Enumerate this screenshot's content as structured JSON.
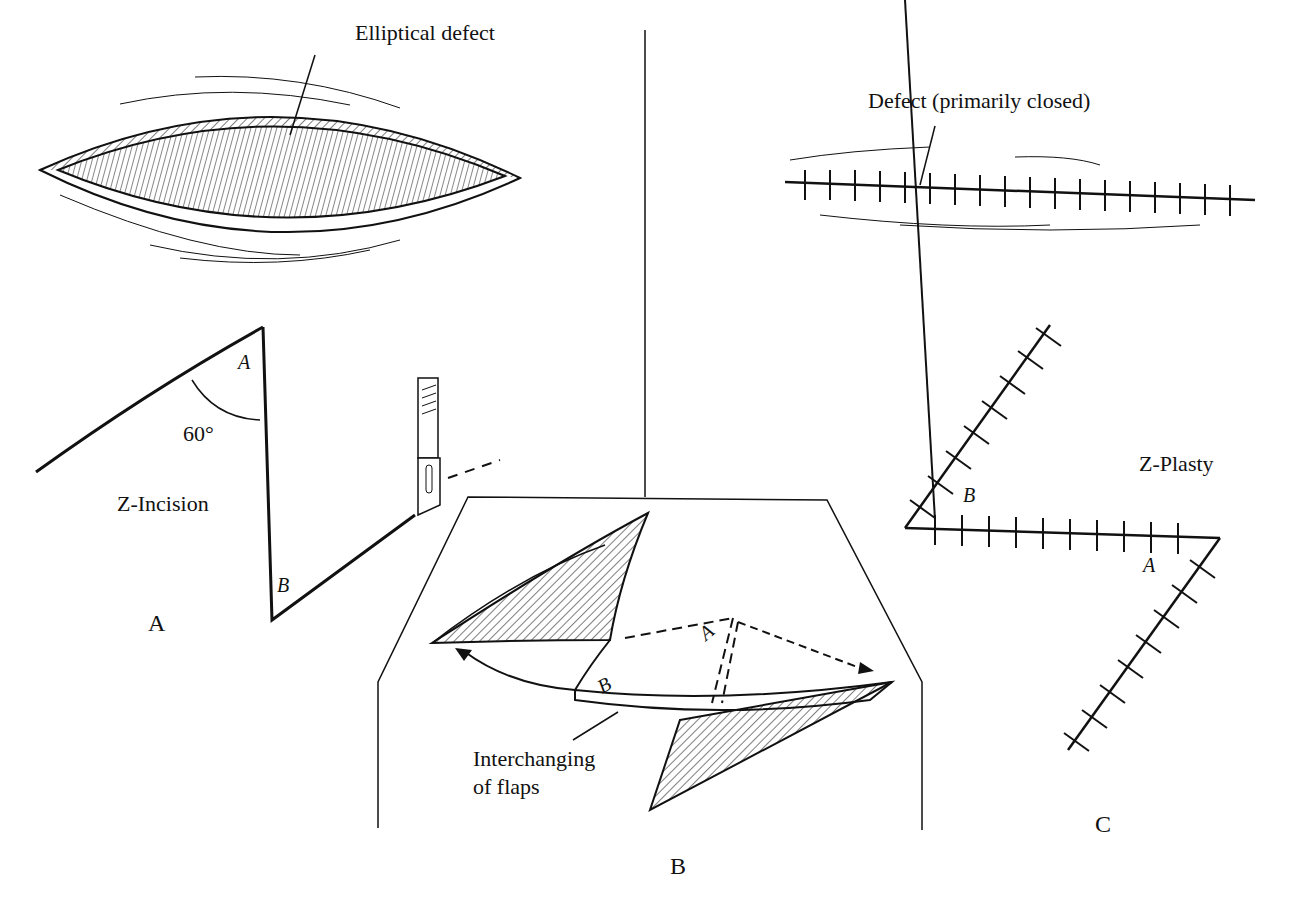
{
  "figure": {
    "panels": [
      {
        "id": "A",
        "label": "A",
        "caption": "Z-Incision",
        "angle_label": "60°",
        "point_labels": [
          "A",
          "B"
        ]
      },
      {
        "id": "B",
        "label": "B",
        "caption": "Interchanging\nof flaps",
        "point_labels": [
          "A",
          "B"
        ]
      },
      {
        "id": "C",
        "label": "C",
        "caption": "Z-Plasty",
        "point_labels": [
          "B",
          "A"
        ]
      }
    ],
    "callouts": {
      "elliptical_defect": "Elliptical defect",
      "defect_closed": "Defect (primarily closed)"
    }
  }
}
